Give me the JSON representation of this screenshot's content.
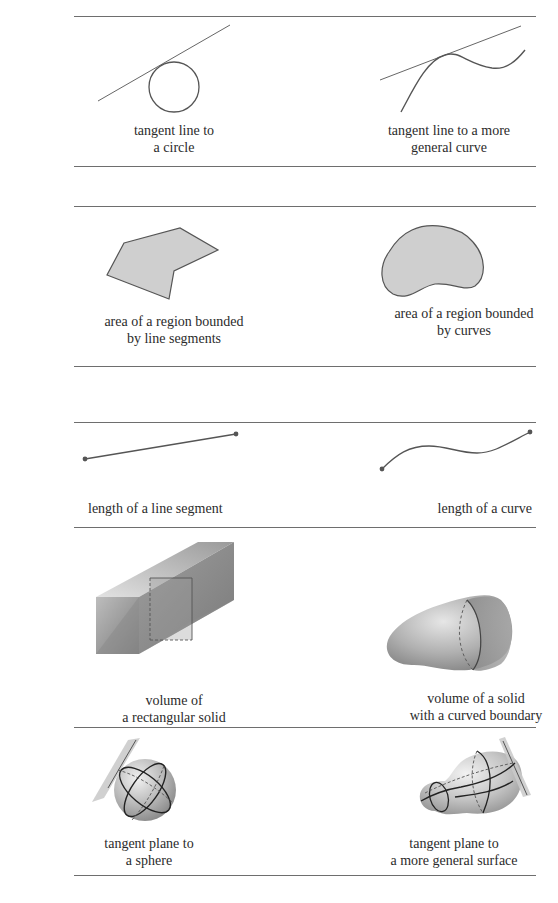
{
  "figure": {
    "rows": [
      {
        "left": {
          "caption": [
            "tangent line to",
            "a circle"
          ]
        },
        "right": {
          "caption": [
            "tangent line to a more",
            "general curve"
          ]
        }
      },
      {
        "left": {
          "caption": [
            "area of a region bounded",
            "by line segments"
          ]
        },
        "right": {
          "caption": [
            "area of a region bounded",
            "by curves"
          ]
        }
      },
      {
        "left": {
          "caption": [
            "length of a line segment"
          ]
        },
        "right": {
          "caption": [
            "length of a curve"
          ]
        }
      },
      {
        "left": {
          "caption": [
            "volume of",
            "a rectangular solid"
          ]
        },
        "right": {
          "caption": [
            "volume of a solid",
            "with a curved boundary"
          ]
        }
      },
      {
        "left": {
          "caption": [
            "tangent plane to",
            "a sphere"
          ]
        },
        "right": {
          "caption": [
            "tangent plane to",
            "a more general surface"
          ]
        }
      }
    ],
    "colors": {
      "rule": "#6e6e6e",
      "stroke": "#555555",
      "region_fill": "#cfcfcf",
      "text": "#2b2b2b"
    }
  }
}
